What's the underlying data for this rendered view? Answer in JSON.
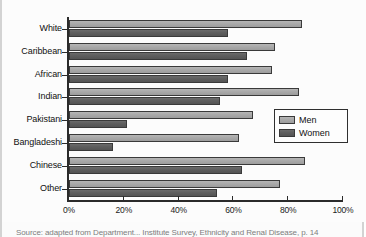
{
  "figure": {
    "caption": "Source: adapted from Department...  Institute Survey, Ethnicity and Renal Disease, p. 14"
  },
  "legend": {
    "position": "inside-right",
    "items": [
      {
        "label": "Men",
        "color": "#a9a9a9",
        "swatch": "men-swatch"
      },
      {
        "label": "Women",
        "color": "#5e5e5e",
        "swatch": "women-swatch"
      }
    ]
  },
  "axis": {
    "x_ticks": [
      "0%",
      "20%",
      "40%",
      "60%",
      "80%",
      "100%"
    ],
    "x_tick_values": [
      0,
      20,
      40,
      60,
      80,
      100
    ]
  },
  "chart_data": {
    "type": "bar",
    "orientation": "horizontal",
    "title": "",
    "xlabel": "",
    "ylabel": "",
    "xlim": [
      0,
      100
    ],
    "grid": false,
    "legend_position": "inside-right",
    "categories": [
      "White",
      "Caribbean",
      "African",
      "Indian",
      "Pakistani",
      "Bangladeshi",
      "Chinese",
      "Other"
    ],
    "series": [
      {
        "name": "Men",
        "color": "#a9a9a9",
        "values": [
          85,
          75,
          74,
          84,
          67,
          62,
          86,
          77
        ]
      },
      {
        "name": "Women",
        "color": "#5e5e5e",
        "values": [
          58,
          65,
          58,
          55,
          21,
          16,
          63,
          54
        ]
      }
    ],
    "units": "%"
  }
}
